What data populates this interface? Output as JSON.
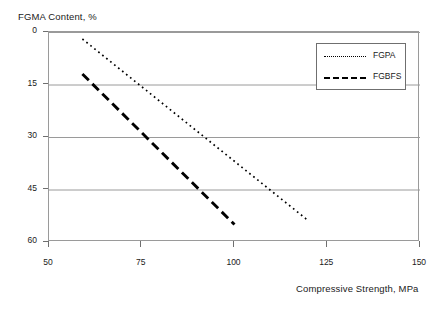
{
  "chart_data": {
    "type": "line",
    "title": "",
    "xlabel": "Compressive Strength, MPa",
    "ylabel": "FGMA Content, %",
    "xlim": [
      50,
      150
    ],
    "ylim": [
      0,
      60
    ],
    "xticks": [
      50,
      75,
      100,
      125,
      150
    ],
    "yticks": [
      0,
      15,
      30,
      45,
      60
    ],
    "grid": "horizontal",
    "legend_position": "top-right",
    "series": [
      {
        "name": "FGPA",
        "style": "dotted",
        "color": "#000000",
        "points": [
          {
            "x": 59,
            "y": 58
          },
          {
            "x": 120,
            "y": 6
          }
        ]
      },
      {
        "name": "FGBFS",
        "style": "dashed",
        "color": "#000000",
        "points": [
          {
            "x": 59,
            "y": 48
          },
          {
            "x": 100,
            "y": 5
          }
        ]
      }
    ]
  },
  "axes": {
    "y_title": "FGMA Content, %",
    "x_title": "Compressive Strength, MPa",
    "y_tick_labels": [
      "60",
      "45",
      "30",
      "15",
      "0"
    ],
    "x_tick_labels": [
      "50",
      "75",
      "100",
      "125",
      "150"
    ]
  },
  "legend": {
    "entries": [
      {
        "label": "FGPA",
        "style": "dotted"
      },
      {
        "label": "FGBFS",
        "style": "dashed"
      }
    ]
  }
}
